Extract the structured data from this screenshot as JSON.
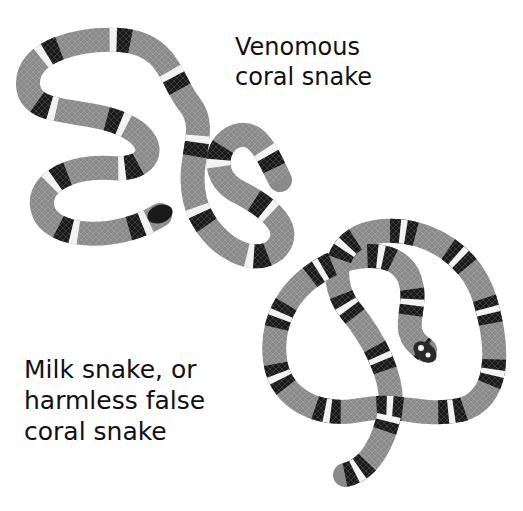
{
  "figure": {
    "labels": {
      "top": "Venomous\ncoral snake",
      "bottom": "Milk snake, or\nharmless false\ncoral snake"
    },
    "colors": {
      "background": "#ffffff",
      "band_red_gray": "#8a8a8a",
      "band_black": "#1a1a1a",
      "band_white": "#f2f2f2",
      "text": "#111111"
    },
    "illustrations": [
      {
        "name": "venomous-coral-snake",
        "pattern": "red-yellow-black-yellow bands (grayscale)",
        "head": "black snout"
      },
      {
        "name": "milk-snake",
        "pattern": "red-black-white-black bands (grayscale)",
        "head": "black and white mottled"
      }
    ]
  }
}
